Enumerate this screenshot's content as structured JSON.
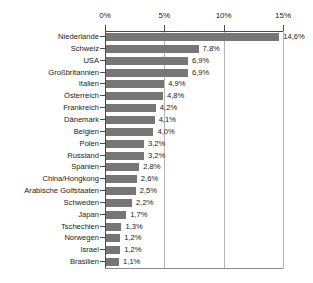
{
  "chart_data": {
    "type": "bar",
    "orientation": "horizontal",
    "title": "",
    "subtitle": "",
    "xlabel": "",
    "ylabel": "",
    "xlim": [
      0,
      15
    ],
    "grid": true,
    "legend": false,
    "value_suffix": "%",
    "decimal_separator": ",",
    "bar_color": "#767676",
    "axis_color": "#4a4a4a",
    "grid_color": "#b5b5b5",
    "text_color": "#1a1a1a",
    "background_color": "#ffffff",
    "xticks": [
      {
        "value": 0,
        "label": "0%"
      },
      {
        "value": 5,
        "label": "5%"
      },
      {
        "value": 10,
        "label": "10%"
      },
      {
        "value": 15,
        "label": "15%"
      }
    ],
    "categories": [
      "Niederlande",
      "Schweiz",
      "USA",
      "Großbritannien",
      "Italien",
      "Österreich",
      "Frankreich",
      "Dänemark",
      "Belgien",
      "Polen",
      "Russland",
      "Spanien",
      "China/Hongkong",
      "Arabische Golfstaaten",
      "Schweden",
      "Japan",
      "Tschechien",
      "Norwegen",
      "Israel",
      "Brasilien"
    ],
    "values": [
      14.6,
      7.8,
      6.9,
      6.9,
      4.9,
      4.8,
      4.2,
      4.1,
      4.0,
      3.2,
      3.2,
      2.8,
      2.6,
      2.5,
      2.2,
      1.7,
      1.3,
      1.2,
      1.2,
      1.1
    ],
    "data_labels": [
      "14,6%",
      "7,8%",
      "6,9%",
      "6,9%",
      "4,9%",
      "4,8%",
      "4,2%",
      "4,1%",
      "4,0%",
      "3,2%",
      "3,2%",
      "2,8%",
      "2,6%",
      "2,5%",
      "2,2%",
      "1,7%",
      "1,3%",
      "1,2%",
      "1,2%",
      "1,1%"
    ],
    "points": [
      {
        "category": "Niederlande",
        "value": 14.6,
        "label": "14,6%"
      },
      {
        "category": "Schweiz",
        "value": 7.8,
        "label": "7,8%"
      },
      {
        "category": "USA",
        "value": 6.9,
        "label": "6,9%"
      },
      {
        "category": "Großbritannien",
        "value": 6.9,
        "label": "6,9%"
      },
      {
        "category": "Italien",
        "value": 4.9,
        "label": "4,9%"
      },
      {
        "category": "Österreich",
        "value": 4.8,
        "label": "4,8%"
      },
      {
        "category": "Frankreich",
        "value": 4.2,
        "label": "4,2%"
      },
      {
        "category": "Dänemark",
        "value": 4.1,
        "label": "4,1%"
      },
      {
        "category": "Belgien",
        "value": 4.0,
        "label": "4,0%"
      },
      {
        "category": "Polen",
        "value": 3.2,
        "label": "3,2%"
      },
      {
        "category": "Russland",
        "value": 3.2,
        "label": "3,2%"
      },
      {
        "category": "Spanien",
        "value": 2.8,
        "label": "2,8%"
      },
      {
        "category": "China/Hongkong",
        "value": 2.6,
        "label": "2,6%"
      },
      {
        "category": "Arabische Golfstaaten",
        "value": 2.5,
        "label": "2,5%"
      },
      {
        "category": "Schweden",
        "value": 2.2,
        "label": "2,2%"
      },
      {
        "category": "Japan",
        "value": 1.7,
        "label": "1,7%"
      },
      {
        "category": "Tschechien",
        "value": 1.3,
        "label": "1,3%"
      },
      {
        "category": "Norwegen",
        "value": 1.2,
        "label": "1,2%"
      },
      {
        "category": "Israel",
        "value": 1.2,
        "label": "1,2%"
      },
      {
        "category": "Brasilien",
        "value": 1.1,
        "label": "1,1%"
      }
    ]
  }
}
